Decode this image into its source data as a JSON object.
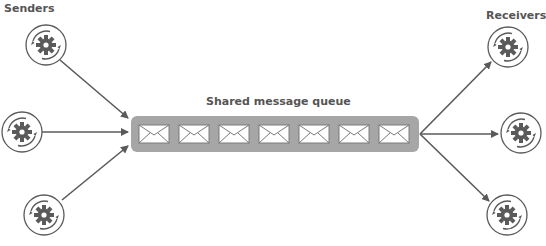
{
  "labels": {
    "senders": "Senders",
    "receivers": "Receivers",
    "queue": "Shared message queue"
  },
  "senders": [
    {
      "name": "sender-1",
      "icon": "gear-cycle-icon",
      "cx": 46,
      "cy": 45
    },
    {
      "name": "sender-2",
      "icon": "gear-cycle-icon",
      "cx": 22,
      "cy": 132
    },
    {
      "name": "sender-3",
      "icon": "gear-cycle-icon",
      "cx": 44,
      "cy": 215
    }
  ],
  "receivers": [
    {
      "name": "receiver-1",
      "icon": "gear-cycle-icon",
      "cx": 508,
      "cy": 47
    },
    {
      "name": "receiver-2",
      "icon": "gear-cycle-icon",
      "cx": 521,
      "cy": 133
    },
    {
      "name": "receiver-3",
      "icon": "gear-cycle-icon",
      "cx": 507,
      "cy": 215
    }
  ],
  "queue": {
    "message_count": 7,
    "message_icon": "envelope-icon"
  },
  "colors": {
    "stroke": "#5a5a5a",
    "queue_fill": "#a6a6a6",
    "envelope_fill": "#ffffff",
    "text": "#555555"
  }
}
